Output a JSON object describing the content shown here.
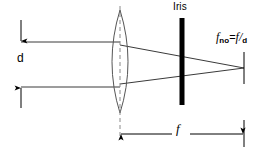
{
  "diagram": {
    "labels": {
      "aperture_diameter": "d",
      "iris": "Iris",
      "focal_length": "f"
    },
    "formula": {
      "symbol": "f",
      "symbol_subscript": "no",
      "equals": "=",
      "numerator": "f",
      "slash": "/",
      "denominator": "d",
      "plain": "f_no = f/d"
    },
    "colors": {
      "ink": "#000000",
      "ray": "#3a3a3a",
      "lens_outline": "#555555",
      "axis_dashed": "#888888",
      "background": "#ffffff"
    },
    "geometry": {
      "ray_top_y": 42,
      "ray_bottom_y": 87,
      "lens_center_x": 120,
      "lens_top_y": 10,
      "lens_bottom_y": 113,
      "lens_half_width": 16,
      "iris_x": 182,
      "iris_top_y": 18,
      "iris_bottom_y": 105,
      "focus_x": 244,
      "focus_y": 68,
      "dim_d_x": 21,
      "dim_f_y": 134
    }
  }
}
